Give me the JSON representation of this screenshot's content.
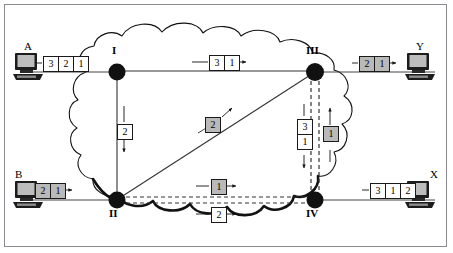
{
  "diagram": {
    "type": "network-diagram",
    "colors": {
      "frame_border": "#8a8a90",
      "cloud_outline": "#000000",
      "node_fill": "#111111",
      "packet_white": "#ffffff",
      "packet_gray": "#b9b9b9",
      "link": "#333333",
      "background": "#ffffff"
    }
  },
  "hosts": [
    {
      "id": "host-a",
      "label": "A",
      "role": "sender",
      "icon": "computer-icon",
      "packets": [
        {
          "value": "3",
          "shade": "white"
        },
        {
          "value": "2",
          "shade": "white"
        },
        {
          "value": "1",
          "shade": "white"
        }
      ],
      "arrow": "right"
    },
    {
      "id": "host-b",
      "label": "B",
      "role": "sender",
      "icon": "computer-icon",
      "packets": [
        {
          "value": "2",
          "shade": "gray"
        },
        {
          "value": "1",
          "shade": "gray"
        }
      ],
      "arrow": "right"
    },
    {
      "id": "host-y",
      "label": "Y",
      "role": "receiver",
      "icon": "computer-icon",
      "packets": [
        {
          "value": "2",
          "shade": "gray"
        },
        {
          "value": "1",
          "shade": "gray"
        }
      ],
      "arrow": "right"
    },
    {
      "id": "host-x",
      "label": "X",
      "role": "receiver",
      "icon": "computer-icon",
      "packets": [
        {
          "value": "3",
          "shade": "white"
        },
        {
          "value": "1",
          "shade": "white"
        },
        {
          "value": "2",
          "shade": "white"
        }
      ],
      "arrow": "right"
    }
  ],
  "nodes": [
    {
      "id": "node-1",
      "label": "I",
      "position": "top-left"
    },
    {
      "id": "node-2",
      "label": "II",
      "position": "bottom-left"
    },
    {
      "id": "node-3",
      "label": "III",
      "position": "top-right"
    },
    {
      "id": "node-4",
      "label": "IV",
      "position": "bottom-right"
    }
  ],
  "link_packets": [
    {
      "id": "link-i-iii",
      "from": "I",
      "to": "III",
      "direction": "right",
      "style": "solid",
      "packets": [
        {
          "value": "3",
          "shade": "white"
        },
        {
          "value": "1",
          "shade": "white"
        }
      ]
    },
    {
      "id": "link-i-ii",
      "from": "I",
      "to": "II",
      "direction": "down",
      "style": "solid",
      "packets": [
        {
          "value": "2",
          "shade": "white"
        }
      ]
    },
    {
      "id": "link-ii-iii",
      "from": "II",
      "to": "III",
      "direction": "up-right",
      "style": "solid",
      "packets": [
        {
          "value": "2",
          "shade": "gray"
        }
      ]
    },
    {
      "id": "link-iii-iv",
      "from": "III",
      "to": "IV",
      "direction": "down",
      "style": "dashed",
      "packets": [
        {
          "value": "3",
          "shade": "white"
        },
        {
          "value": "1",
          "shade": "white"
        }
      ]
    },
    {
      "id": "link-iv-iii",
      "from": "IV",
      "to": "III",
      "direction": "up",
      "style": "dashed",
      "packets": [
        {
          "value": "1",
          "shade": "gray"
        }
      ]
    },
    {
      "id": "link-ii-iv-upper",
      "from": "II",
      "to": "IV",
      "direction": "right",
      "style": "dashed",
      "packets": [
        {
          "value": "1",
          "shade": "gray"
        }
      ]
    },
    {
      "id": "link-ii-iv-lower",
      "from": "II",
      "to": "IV",
      "direction": "right",
      "style": "dashed",
      "packets": [
        {
          "value": "2",
          "shade": "white"
        }
      ]
    }
  ]
}
